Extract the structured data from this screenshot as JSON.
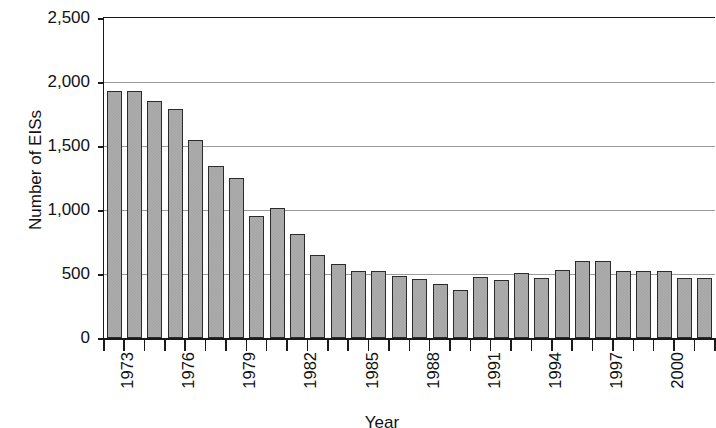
{
  "chart_data": {
    "type": "bar",
    "title": "",
    "xlabel": "Year",
    "ylabel": "Number of EISs",
    "ylim": [
      0,
      2500
    ],
    "ytick_values": [
      0,
      500,
      1000,
      1500,
      2000,
      2500
    ],
    "ytick_labels": [
      "0",
      "500",
      "1,000",
      "1,500",
      "2,000",
      "2,500"
    ],
    "grid": "horizontal",
    "legend": "none",
    "bar_color": "#a3a3a3",
    "bar_edge_color": "#2b2b2b",
    "categories": [
      "1973",
      "1974",
      "1975",
      "1976",
      "1977",
      "1978",
      "1979",
      "1980",
      "1981",
      "1982",
      "1983",
      "1984",
      "1985",
      "1986",
      "1987",
      "1988",
      "1989",
      "1990",
      "1991",
      "1992",
      "1993",
      "1994",
      "1995",
      "1996",
      "1997",
      "1998",
      "1999",
      "2000",
      "2001",
      "2002"
    ],
    "values": [
      1930,
      1930,
      1850,
      1790,
      1545,
      1340,
      1250,
      950,
      1015,
      815,
      650,
      575,
      525,
      520,
      485,
      460,
      425,
      375,
      480,
      455,
      510,
      470,
      535,
      600,
      605,
      520,
      520,
      525,
      470,
      470
    ],
    "xtick_labels": [
      "1973",
      "1976",
      "1979",
      "1982",
      "1985",
      "1988",
      "1991",
      "1994",
      "1997",
      "2000"
    ]
  }
}
